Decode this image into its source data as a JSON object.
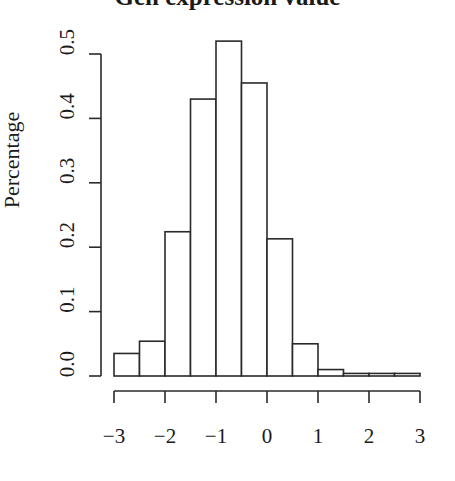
{
  "chart_data": {
    "type": "bar",
    "title": "Gen expression value",
    "xlabel": "",
    "ylabel": "Percentage",
    "bin_edges": [
      -3,
      -2.5,
      -2,
      -1.5,
      -1,
      -0.5,
      0,
      0.5,
      1,
      1.5,
      2,
      2.5,
      3
    ],
    "categories": [
      "-3 to -2.5",
      "-2.5 to -2",
      "-2 to -1.5",
      "-1.5 to -1",
      "-1 to -0.5",
      "-0.5 to 0",
      "0 to 0.5",
      "0.5 to 1",
      "1 to 1.5",
      "1.5 to 2",
      "2 to 2.5",
      "2.5 to 3"
    ],
    "values": [
      0.035,
      0.054,
      0.224,
      0.43,
      0.52,
      0.455,
      0.213,
      0.05,
      0.01,
      0.004,
      0.004,
      0.004
    ],
    "xlim": [
      -3,
      3
    ],
    "ylim": [
      0,
      0.5
    ],
    "xticks": [
      -3,
      -2,
      -1,
      0,
      1,
      2,
      3
    ],
    "xtick_labels": [
      "−3",
      "−2",
      "−1",
      "0",
      "1",
      "2",
      "3"
    ],
    "yticks": [
      0.0,
      0.1,
      0.2,
      0.3,
      0.4,
      0.5
    ],
    "ytick_labels": [
      "0.0",
      "0.1",
      "0.2",
      "0.3",
      "0.4",
      "0.5"
    ],
    "grid": false,
    "legend": null,
    "bar_fill": "#ffffff",
    "bar_stroke": "#2a2a2a"
  }
}
